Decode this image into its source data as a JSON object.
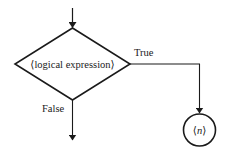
{
  "diagram": {
    "type": "flowchart",
    "title": "",
    "colors": {
      "stroke": "#1a1a1a",
      "background": "#ffffff",
      "text": "#1a1a1a"
    },
    "nodes": [
      {
        "id": "decision",
        "shape": "diamond",
        "label": "⟨logical expression⟩"
      },
      {
        "id": "connector",
        "shape": "circle",
        "label": "⟨n⟩",
        "label_italic_part": "n"
      }
    ],
    "edges": [
      {
        "from": "entry",
        "to": "decision",
        "label": ""
      },
      {
        "from": "decision",
        "to": "connector",
        "label": "True"
      },
      {
        "from": "decision",
        "to": "exit",
        "label": "False"
      }
    ],
    "labels": {
      "decision_text": "⟨logical expression⟩",
      "true_label": "True",
      "false_label": "False",
      "connector_open": "⟨",
      "connector_var": "n",
      "connector_close": "⟩"
    }
  }
}
